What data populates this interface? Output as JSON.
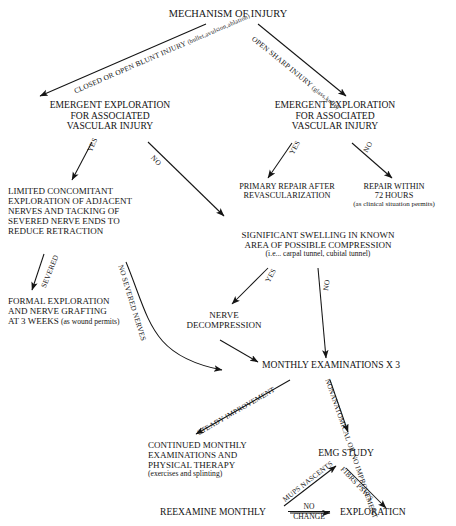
{
  "diagram": {
    "title": "MECHANISM OF INJURY",
    "nodes": {
      "root": "MECHANISM OF INJURY",
      "left_emergent": [
        "EMERGENT EXPLORATION",
        "FOR ASSOCIATED",
        "VASCULAR INJURY"
      ],
      "right_emergent": [
        "EMERGENT EXPLORATION",
        "FOR ASSOCIATED",
        "VASCULAR INJURY"
      ],
      "primary_repair": [
        "PRIMARY REPAIR AFTER",
        "REVASCULARIZATION"
      ],
      "repair_72": [
        "REPAIR WITHIN",
        "72 HOURS"
      ],
      "repair_72_note": "(as clinical situation permits)",
      "limited_concomitant": [
        "LIMITED CONCOMITANT",
        "EXPLORATION OF ADJACENT",
        "NERVES AND TACKING OF",
        "SEVERED NERVE ENDS TO",
        "REDUCE RETRACTION"
      ],
      "significant_swelling": [
        "SIGNIFICANT SWELLING IN KNOWN",
        "AREA OF POSSIBLE COMPRESSION"
      ],
      "significant_swelling_note": "(i.e... carpal tunnel, cubital tunnel)",
      "formal_exploration": [
        "FORMAL EXPLORATION",
        "AND NERVE GRAFTING"
      ],
      "formal_exploration_last": "AT 3 WEEKS ",
      "formal_exploration_note": "(as wound permits)",
      "nerve_decompression": [
        "NERVE",
        "DECOMPRESSION"
      ],
      "monthly_exams": "MONTHLY EXAMINATIONS X 3",
      "continued_monthly": [
        "CONTINUED MONTHLY",
        "EXAMINATIONS AND",
        "PHYSICAL THERAPY"
      ],
      "continued_monthly_note": "(exercises and splinting)",
      "emg_study": "EMG STUDY",
      "reexamine": "REEXAMINE MONTHLY",
      "exploration": "EXPLORATICN"
    },
    "edge_labels": {
      "closed_blunt": "CLOSED OR",
      "closed_blunt2": "OPEN BLUNT INJURY",
      "closed_blunt_note": "(bullet,avulsion,ablation)",
      "open_sharp": "OPEN SHARP INJURY",
      "open_sharp_note": "(glass,knife)",
      "left_yes": "YES",
      "left_no": "NO",
      "right_yes": "YES",
      "right_no": "NO",
      "severed": "SEVERED",
      "no_severed": "NO SEVERED NERVES",
      "swelling_yes": "YES",
      "swelling_no": "NO",
      "steady_improvement": "STEADY IMPROVEMENT",
      "nonanatomical": "NONANATOMICAL OR",
      "no_improvement": "NO IMPROVEMENT",
      "mups": "MUPS",
      "nascents": "NASCENTS",
      "fibrs": "FIBRS",
      "psws": "PSW'S",
      "no_change_top": "NO",
      "no_change_bottom": "CHANGE"
    },
    "colors": {
      "ink": "#141414",
      "background": "#ffffff"
    }
  }
}
